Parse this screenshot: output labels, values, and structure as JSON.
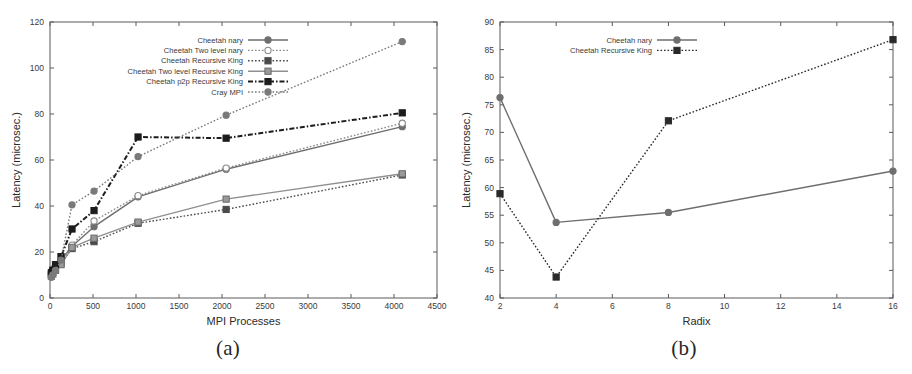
{
  "figure": {
    "panels": [
      {
        "caption": "(a)",
        "chart_ref": 0
      },
      {
        "caption": "(b)",
        "chart_ref": 1
      }
    ]
  },
  "chart_data": [
    {
      "type": "line",
      "title": "",
      "xlabel": "MPI Processes",
      "ylabel": "Latency (microsec.)",
      "xlim": [
        0,
        4500
      ],
      "ylim": [
        0,
        120
      ],
      "xticks": [
        0,
        500,
        1000,
        1500,
        2000,
        2500,
        3000,
        3500,
        4000,
        4500
      ],
      "xtick_labels": [
        "0",
        "500",
        "1000",
        "1500",
        "2000",
        "2500",
        "3000",
        "3500",
        "4000",
        "4500"
      ],
      "yticks": [
        0,
        20,
        40,
        60,
        80,
        100,
        120
      ],
      "ytick_labels": [
        "0",
        "20",
        "40",
        "60",
        "80",
        "100",
        "120"
      ],
      "grid": false,
      "legend_position": "top-center",
      "series": [
        {
          "name": "Cheetah nary",
          "style": "solid",
          "marker": "circle",
          "color": "#6e6e6e",
          "x": [
            16,
            32,
            64,
            128,
            256,
            512,
            1024,
            2048,
            4096
          ],
          "y": [
            11.5,
            12.5,
            14.0,
            16.5,
            22.5,
            31.0,
            44.0,
            56.0,
            74.5
          ]
        },
        {
          "name": "Cheetah Two level nary",
          "style": "dotted",
          "marker": "circle-open",
          "color": "#8a8a8a",
          "x": [
            16,
            32,
            64,
            128,
            256,
            512,
            1024,
            2048,
            4096
          ],
          "y": [
            10.5,
            11.5,
            13.0,
            16.0,
            23.0,
            33.5,
            44.5,
            56.5,
            76.0
          ]
        },
        {
          "name": "Cheetah Recursive King",
          "style": "dotted",
          "marker": "square",
          "color": "#4a4a4a",
          "x": [
            16,
            32,
            64,
            128,
            256,
            512,
            1024,
            2048,
            4096
          ],
          "y": [
            10.0,
            11.0,
            12.5,
            15.0,
            21.5,
            24.5,
            32.5,
            38.5,
            53.5
          ]
        },
        {
          "name": "Cheetah Two level Recursive King",
          "style": "solid",
          "marker": "square-grey",
          "color": "#8f8f8f",
          "x": [
            16,
            32,
            64,
            128,
            256,
            512,
            1024,
            2048,
            4096
          ],
          "y": [
            9.5,
            10.5,
            12.0,
            14.5,
            22.0,
            26.0,
            33.0,
            43.0,
            54.0
          ]
        },
        {
          "name": "Cheetah p2p Recursive King",
          "style": "dash-dot",
          "marker": "square-filled",
          "color": "#1c1c1c",
          "x": [
            16,
            32,
            64,
            128,
            256,
            512,
            1024,
            2048,
            4096
          ],
          "y": [
            11.0,
            12.0,
            14.5,
            18.0,
            30.0,
            38.0,
            70.0,
            69.5,
            80.5
          ]
        },
        {
          "name": "Cray MPI",
          "style": "dotted",
          "marker": "circle-filled",
          "color": "#7a7a7a",
          "x": [
            16,
            32,
            64,
            128,
            256,
            512,
            1024,
            2048,
            4096
          ],
          "y": [
            9.0,
            10.0,
            12.0,
            16.5,
            40.5,
            46.5,
            61.5,
            79.5,
            111.5
          ]
        }
      ]
    },
    {
      "type": "line",
      "title": "",
      "xlabel": "Radix",
      "ylabel": "Latency (microsec.)",
      "xlim": [
        2,
        16
      ],
      "ylim": [
        40,
        90
      ],
      "xticks": [
        2,
        4,
        6,
        8,
        10,
        12,
        14,
        16
      ],
      "xtick_labels": [
        "2",
        "4",
        "6",
        "8",
        "10",
        "12",
        "14",
        "16"
      ],
      "yticks": [
        40,
        45,
        50,
        55,
        60,
        65,
        70,
        75,
        80,
        85,
        90
      ],
      "ytick_labels": [
        "40",
        "45",
        "50",
        "55",
        "60",
        "65",
        "70",
        "75",
        "80",
        "85",
        "90"
      ],
      "grid": false,
      "legend_position": "top-center",
      "series": [
        {
          "name": "Cheetah nary",
          "style": "solid",
          "marker": "circle",
          "color": "#6e6e6e",
          "x": [
            2,
            4,
            8,
            16
          ],
          "y": [
            76.3,
            53.7,
            55.5,
            63.0
          ]
        },
        {
          "name": "Cheetah Recursive King",
          "style": "dotted",
          "marker": "square-filled",
          "color": "#2a2a2a",
          "x": [
            2,
            4,
            8,
            16
          ],
          "y": [
            58.9,
            43.8,
            72.1,
            86.8
          ]
        }
      ]
    }
  ]
}
